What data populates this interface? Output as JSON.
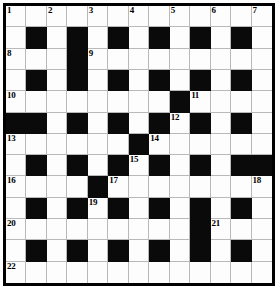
{
  "puzzle": {
    "title": "Crossword Grid",
    "rows": 13,
    "columns": 13,
    "colors": {
      "block": "#0a0a0a",
      "cell": "#fdfdfd",
      "gridline": "#b9b9b9",
      "border": "#000000",
      "number": "#000000"
    },
    "grid": [
      [
        {
          "block": false,
          "num": "1"
        },
        {
          "block": false,
          "num": ""
        },
        {
          "block": false,
          "num": "2"
        },
        {
          "block": false,
          "num": ""
        },
        {
          "block": false,
          "num": "3"
        },
        {
          "block": false,
          "num": ""
        },
        {
          "block": false,
          "num": "4"
        },
        {
          "block": false,
          "num": ""
        },
        {
          "block": false,
          "num": "5"
        },
        {
          "block": false,
          "num": ""
        },
        {
          "block": false,
          "num": "6"
        },
        {
          "block": false,
          "num": ""
        },
        {
          "block": false,
          "num": "7"
        }
      ],
      [
        {
          "block": false,
          "num": ""
        },
        {
          "block": true,
          "num": ""
        },
        {
          "block": false,
          "num": ""
        },
        {
          "block": true,
          "num": ""
        },
        {
          "block": false,
          "num": ""
        },
        {
          "block": true,
          "num": ""
        },
        {
          "block": false,
          "num": ""
        },
        {
          "block": true,
          "num": ""
        },
        {
          "block": false,
          "num": ""
        },
        {
          "block": true,
          "num": ""
        },
        {
          "block": false,
          "num": ""
        },
        {
          "block": true,
          "num": ""
        },
        {
          "block": false,
          "num": ""
        }
      ],
      [
        {
          "block": false,
          "num": "8"
        },
        {
          "block": false,
          "num": ""
        },
        {
          "block": false,
          "num": ""
        },
        {
          "block": true,
          "num": ""
        },
        {
          "block": false,
          "num": "9"
        },
        {
          "block": false,
          "num": ""
        },
        {
          "block": false,
          "num": ""
        },
        {
          "block": false,
          "num": ""
        },
        {
          "block": false,
          "num": ""
        },
        {
          "block": false,
          "num": ""
        },
        {
          "block": false,
          "num": ""
        },
        {
          "block": false,
          "num": ""
        },
        {
          "block": false,
          "num": ""
        }
      ],
      [
        {
          "block": false,
          "num": ""
        },
        {
          "block": true,
          "num": ""
        },
        {
          "block": false,
          "num": ""
        },
        {
          "block": true,
          "num": ""
        },
        {
          "block": false,
          "num": ""
        },
        {
          "block": true,
          "num": ""
        },
        {
          "block": false,
          "num": ""
        },
        {
          "block": true,
          "num": ""
        },
        {
          "block": false,
          "num": ""
        },
        {
          "block": true,
          "num": ""
        },
        {
          "block": false,
          "num": ""
        },
        {
          "block": true,
          "num": ""
        },
        {
          "block": false,
          "num": ""
        }
      ],
      [
        {
          "block": false,
          "num": "10"
        },
        {
          "block": false,
          "num": ""
        },
        {
          "block": false,
          "num": ""
        },
        {
          "block": false,
          "num": ""
        },
        {
          "block": false,
          "num": ""
        },
        {
          "block": false,
          "num": ""
        },
        {
          "block": false,
          "num": ""
        },
        {
          "block": false,
          "num": ""
        },
        {
          "block": true,
          "num": ""
        },
        {
          "block": false,
          "num": "11"
        },
        {
          "block": false,
          "num": ""
        },
        {
          "block": false,
          "num": ""
        },
        {
          "block": false,
          "num": ""
        }
      ],
      [
        {
          "block": true,
          "num": ""
        },
        {
          "block": true,
          "num": ""
        },
        {
          "block": false,
          "num": ""
        },
        {
          "block": true,
          "num": ""
        },
        {
          "block": false,
          "num": ""
        },
        {
          "block": true,
          "num": ""
        },
        {
          "block": false,
          "num": ""
        },
        {
          "block": true,
          "num": ""
        },
        {
          "block": false,
          "num": "12"
        },
        {
          "block": true,
          "num": ""
        },
        {
          "block": false,
          "num": ""
        },
        {
          "block": true,
          "num": ""
        },
        {
          "block": false,
          "num": ""
        }
      ],
      [
        {
          "block": false,
          "num": "13"
        },
        {
          "block": false,
          "num": ""
        },
        {
          "block": false,
          "num": ""
        },
        {
          "block": false,
          "num": ""
        },
        {
          "block": false,
          "num": ""
        },
        {
          "block": false,
          "num": ""
        },
        {
          "block": true,
          "num": ""
        },
        {
          "block": false,
          "num": "14"
        },
        {
          "block": false,
          "num": ""
        },
        {
          "block": false,
          "num": ""
        },
        {
          "block": false,
          "num": ""
        },
        {
          "block": false,
          "num": ""
        },
        {
          "block": false,
          "num": ""
        }
      ],
      [
        {
          "block": false,
          "num": ""
        },
        {
          "block": true,
          "num": ""
        },
        {
          "block": false,
          "num": ""
        },
        {
          "block": true,
          "num": ""
        },
        {
          "block": false,
          "num": ""
        },
        {
          "block": true,
          "num": ""
        },
        {
          "block": false,
          "num": "15"
        },
        {
          "block": true,
          "num": ""
        },
        {
          "block": false,
          "num": ""
        },
        {
          "block": true,
          "num": ""
        },
        {
          "block": false,
          "num": ""
        },
        {
          "block": true,
          "num": ""
        },
        {
          "block": true,
          "num": ""
        }
      ],
      [
        {
          "block": false,
          "num": "16"
        },
        {
          "block": false,
          "num": ""
        },
        {
          "block": false,
          "num": ""
        },
        {
          "block": false,
          "num": ""
        },
        {
          "block": true,
          "num": ""
        },
        {
          "block": false,
          "num": "17"
        },
        {
          "block": false,
          "num": ""
        },
        {
          "block": false,
          "num": ""
        },
        {
          "block": false,
          "num": ""
        },
        {
          "block": false,
          "num": ""
        },
        {
          "block": false,
          "num": ""
        },
        {
          "block": false,
          "num": ""
        },
        {
          "block": false,
          "num": "18"
        }
      ],
      [
        {
          "block": false,
          "num": ""
        },
        {
          "block": true,
          "num": ""
        },
        {
          "block": false,
          "num": ""
        },
        {
          "block": true,
          "num": ""
        },
        {
          "block": false,
          "num": "19"
        },
        {
          "block": true,
          "num": ""
        },
        {
          "block": false,
          "num": ""
        },
        {
          "block": true,
          "num": ""
        },
        {
          "block": false,
          "num": ""
        },
        {
          "block": true,
          "num": ""
        },
        {
          "block": false,
          "num": ""
        },
        {
          "block": true,
          "num": ""
        },
        {
          "block": false,
          "num": ""
        }
      ],
      [
        {
          "block": false,
          "num": "20"
        },
        {
          "block": false,
          "num": ""
        },
        {
          "block": false,
          "num": ""
        },
        {
          "block": false,
          "num": ""
        },
        {
          "block": false,
          "num": ""
        },
        {
          "block": false,
          "num": ""
        },
        {
          "block": false,
          "num": ""
        },
        {
          "block": false,
          "num": ""
        },
        {
          "block": false,
          "num": ""
        },
        {
          "block": true,
          "num": ""
        },
        {
          "block": false,
          "num": "21"
        },
        {
          "block": false,
          "num": ""
        },
        {
          "block": false,
          "num": ""
        }
      ],
      [
        {
          "block": false,
          "num": ""
        },
        {
          "block": true,
          "num": ""
        },
        {
          "block": false,
          "num": ""
        },
        {
          "block": true,
          "num": ""
        },
        {
          "block": false,
          "num": ""
        },
        {
          "block": true,
          "num": ""
        },
        {
          "block": false,
          "num": ""
        },
        {
          "block": true,
          "num": ""
        },
        {
          "block": false,
          "num": ""
        },
        {
          "block": true,
          "num": ""
        },
        {
          "block": false,
          "num": ""
        },
        {
          "block": true,
          "num": ""
        },
        {
          "block": false,
          "num": ""
        }
      ],
      [
        {
          "block": false,
          "num": "22"
        },
        {
          "block": false,
          "num": ""
        },
        {
          "block": false,
          "num": ""
        },
        {
          "block": false,
          "num": ""
        },
        {
          "block": false,
          "num": ""
        },
        {
          "block": false,
          "num": ""
        },
        {
          "block": false,
          "num": ""
        },
        {
          "block": false,
          "num": ""
        },
        {
          "block": false,
          "num": ""
        },
        {
          "block": false,
          "num": ""
        },
        {
          "block": false,
          "num": ""
        },
        {
          "block": false,
          "num": ""
        },
        {
          "block": false,
          "num": ""
        }
      ]
    ],
    "clue_numbers": [
      "1",
      "2",
      "3",
      "4",
      "5",
      "6",
      "7",
      "8",
      "9",
      "10",
      "11",
      "12",
      "13",
      "14",
      "15",
      "16",
      "17",
      "18",
      "19",
      "20",
      "21",
      "22"
    ]
  }
}
